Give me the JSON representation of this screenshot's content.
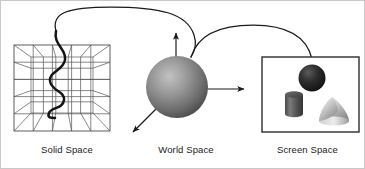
{
  "figure": {
    "background_color": "#ffffff",
    "border_color": "#c8c8c8",
    "line_color": "#1b1b1b",
    "width": 365,
    "height": 169
  },
  "captions": {
    "solid": "Solid Space",
    "world": "World Space",
    "screen": "Screen Space"
  },
  "panels": {
    "solid_space": {
      "label": "Solid Space",
      "shape": "wireframe-perspective-cube",
      "grid_color": "#4a4a4a",
      "curve_color": "#141414",
      "contents": "wavy-serpentine-curve",
      "grid_divisions": 5
    },
    "world_space": {
      "label": "World Space",
      "shape": "shaded-sphere",
      "sphere_fill_light": "#b4b4b4",
      "sphere_fill_dark": "#4b4b4b",
      "axes": [
        {
          "name": "y-axis-arrow",
          "direction": "up"
        },
        {
          "name": "x-axis-arrow",
          "direction": "right"
        },
        {
          "name": "z-axis-arrow",
          "direction": "down-left"
        }
      ]
    },
    "screen_space": {
      "label": "Screen Space",
      "shape": "rectangular-frame",
      "frame_color": "#3a3a3a",
      "objects": [
        {
          "name": "sphere",
          "fill_light": "#4a4a4a",
          "fill_dark": "#151515"
        },
        {
          "name": "cylinder",
          "fill_light": "#6d6d6d",
          "fill_dark": "#3c3c3c"
        },
        {
          "name": "cone",
          "fill_light": "#e6e6e6",
          "fill_dark": "#8f8f8f"
        }
      ]
    }
  },
  "connectors": [
    {
      "name": "solid-to-world-arc",
      "from": "Solid Space",
      "to": "World Space"
    },
    {
      "name": "world-to-screen-arc",
      "from": "World Space",
      "to": "Screen Space"
    }
  ]
}
